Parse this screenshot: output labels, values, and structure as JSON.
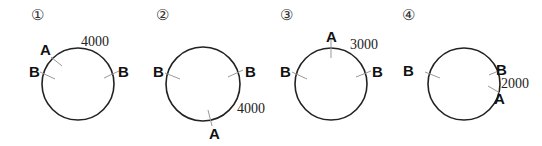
{
  "figure": {
    "panels": [
      {
        "number": "①",
        "circle": {
          "cx": 78,
          "cy": 84,
          "r": 36
        },
        "points": [
          {
            "label": "A",
            "angle_deg": 130
          },
          {
            "label": "B",
            "angle_deg": 160
          },
          {
            "label": "B",
            "angle_deg": 18
          }
        ],
        "distance_label": "4000"
      },
      {
        "number": "②",
        "circle": {
          "cx": 203,
          "cy": 84,
          "r": 37
        },
        "points": [
          {
            "label": "B",
            "angle_deg": 162
          },
          {
            "label": "B",
            "angle_deg": 20
          },
          {
            "label": "A",
            "angle_deg": -75
          }
        ],
        "distance_label": "4000"
      },
      {
        "number": "③",
        "circle": {
          "cx": 331,
          "cy": 84,
          "r": 36
        },
        "points": [
          {
            "label": "A",
            "angle_deg": 90
          },
          {
            "label": "B",
            "angle_deg": 162
          },
          {
            "label": "B",
            "angle_deg": 18
          }
        ],
        "distance_label": "3000"
      },
      {
        "number": "④",
        "circle": {
          "cx": 464,
          "cy": 84,
          "r": 36
        },
        "points": [
          {
            "label": "B",
            "angle_deg": 162
          },
          {
            "label": "B",
            "angle_deg": 20
          },
          {
            "label": "A",
            "angle_deg": -22
          }
        ],
        "distance_label": "2000"
      }
    ]
  }
}
